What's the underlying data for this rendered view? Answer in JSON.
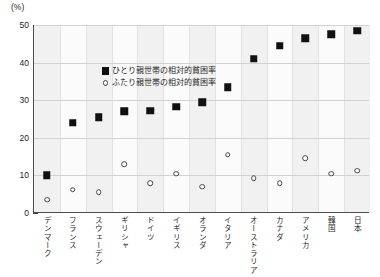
{
  "chart_data": {
    "type": "scatter",
    "title": "",
    "unit_label": "(%)",
    "xlabel": "",
    "ylabel": "",
    "ylim": [
      0,
      50
    ],
    "yticks": [
      0,
      10,
      20,
      30,
      40,
      50
    ],
    "grid": true,
    "legend_position": "top-left-inside",
    "categories": [
      "デンマーク",
      "フランス",
      "スウェーデン",
      "ギリシャ",
      "ドイツ",
      "イギリス",
      "オランダ",
      "イタリア",
      "オーストラリア",
      "カナダ",
      "アメリカ",
      "韓国",
      "日本"
    ],
    "series": [
      {
        "name": "ひとり親世帯の相対的貧困率",
        "marker": "filled-square",
        "values": [
          10.0,
          24.0,
          25.5,
          27.0,
          27.2,
          28.3,
          29.5,
          33.5,
          41.0,
          44.5,
          46.5,
          47.5,
          48.5
        ]
      },
      {
        "name": "ふたり親世帯の相対的貧困率",
        "marker": "open-circle",
        "values": [
          3.5,
          6.2,
          5.6,
          13.0,
          8.0,
          10.5,
          7.0,
          15.5,
          9.3,
          8.0,
          14.5,
          10.5,
          11.2
        ]
      }
    ]
  },
  "legend": {
    "items": [
      {
        "label": "ひとり親世帯の相対的貧困率",
        "marker": "filled-square"
      },
      {
        "label": "ふたり親世帯の相対的貧困率",
        "marker": "open-circle"
      }
    ]
  }
}
